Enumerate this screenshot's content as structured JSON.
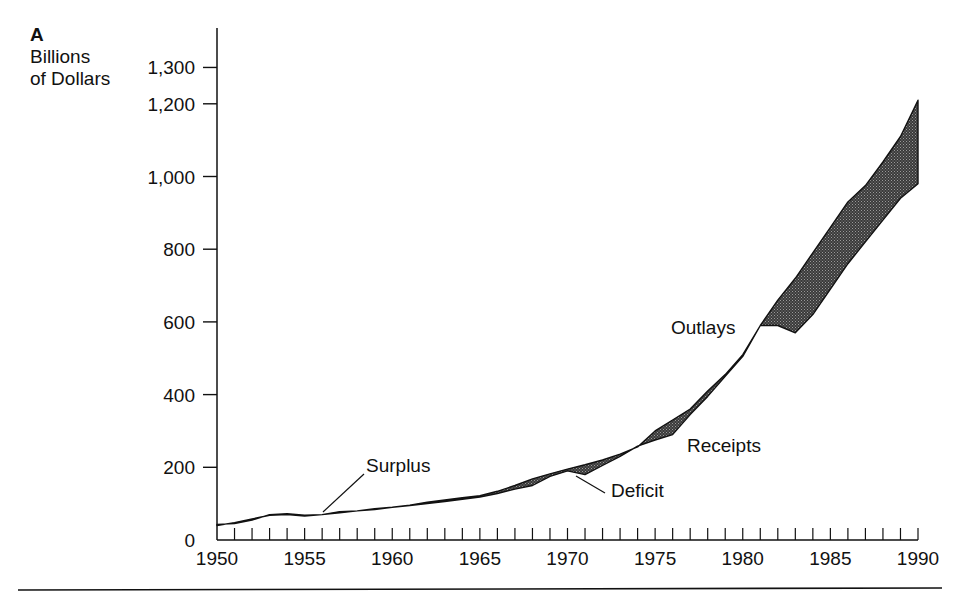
{
  "figure": {
    "panel_label": "A",
    "ylabel_lines": [
      "Billions",
      "of Dollars"
    ]
  },
  "chart_data": {
    "type": "area",
    "title": "",
    "panel": "A",
    "xlabel": "",
    "ylabel": "Billions of Dollars",
    "xlim": [
      1950,
      1990
    ],
    "ylim": [
      0,
      1300
    ],
    "x_ticks": [
      1950,
      1955,
      1960,
      1965,
      1970,
      1975,
      1980,
      1985,
      1990
    ],
    "y_ticks": [
      0,
      200,
      400,
      600,
      800,
      1000,
      1200,
      1300
    ],
    "y_tick_labels": [
      "0",
      "200",
      "400",
      "600",
      "800",
      "1,000",
      "1,200",
      "1,300"
    ],
    "minor_x_ticks": "every year",
    "grid": false,
    "legend": null,
    "fill_between": "shaded region between Outlays and Receipts (deficit/surplus)",
    "x": [
      1950,
      1951,
      1952,
      1953,
      1954,
      1955,
      1956,
      1957,
      1958,
      1959,
      1960,
      1961,
      1962,
      1963,
      1964,
      1965,
      1966,
      1967,
      1968,
      1969,
      1970,
      1971,
      1972,
      1973,
      1974,
      1975,
      1976,
      1977,
      1978,
      1979,
      1980,
      1981,
      1982,
      1983,
      1984,
      1985,
      1986,
      1987,
      1988,
      1989,
      1990
    ],
    "series": [
      {
        "name": "Outlays",
        "values": [
          43,
          45,
          55,
          70,
          72,
          68,
          70,
          75,
          80,
          86,
          90,
          96,
          104,
          110,
          116,
          122,
          134,
          150,
          168,
          182,
          195,
          207,
          220,
          236,
          256,
          300,
          330,
          360,
          410,
          455,
          510,
          590,
          660,
          720,
          790,
          860,
          930,
          975,
          1040,
          1110,
          1210
        ]
      },
      {
        "name": "Receipts",
        "values": [
          40,
          48,
          58,
          68,
          70,
          66,
          70,
          78,
          80,
          84,
          90,
          95,
          100,
          106,
          112,
          118,
          128,
          140,
          150,
          175,
          190,
          180,
          205,
          230,
          258,
          275,
          290,
          345,
          395,
          450,
          505,
          590,
          590,
          570,
          620,
          690,
          760,
          820,
          880,
          940,
          980
        ]
      }
    ],
    "annotations": [
      {
        "text": "Surplus",
        "x": 1955.5,
        "y": 75
      },
      {
        "text": "Deficit",
        "x": 1970.8,
        "y": 185
      },
      {
        "text": "Outlays",
        "x": 1980.5,
        "y": 600
      },
      {
        "text": "Receipts",
        "x": 1977,
        "y": 285
      }
    ]
  }
}
